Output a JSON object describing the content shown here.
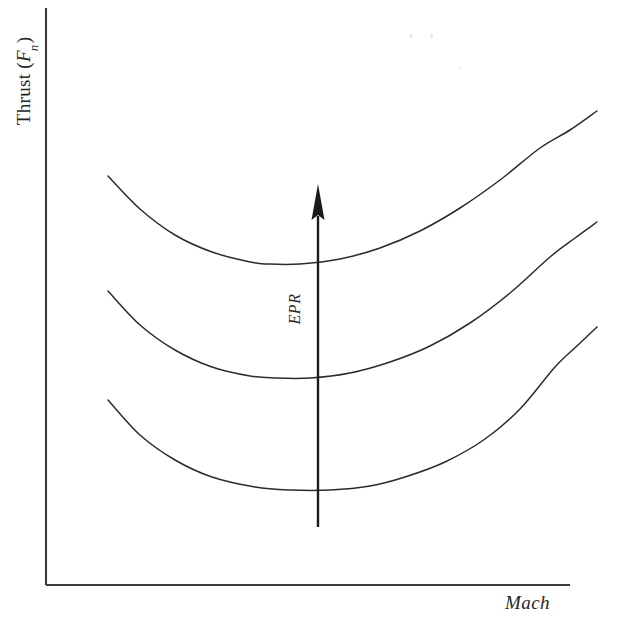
{
  "chart_data": {
    "type": "line",
    "title": "",
    "xlabel": "Mach",
    "ylabel": "Thrust (Fn)",
    "ylabel_main": "Thrust (",
    "ylabel_var": "F",
    "ylabel_sub": "n",
    "ylabel_close": ")",
    "grid": false,
    "legend": "none",
    "axis_ticks": "none",
    "xlim": [
      0,
      1
    ],
    "ylim": [
      0,
      1
    ],
    "annotations": [
      {
        "name": "epr-arrow",
        "text": "EPR",
        "direction": "up",
        "meaning": "Engine Pressure Ratio increasing",
        "x_px": 318,
        "y_start_px": 527,
        "y_end_px": 184
      }
    ],
    "series": [
      {
        "name": "High EPR",
        "order": 3,
        "points": [
          [
            108,
            176
          ],
          [
            140,
            209
          ],
          [
            175,
            235
          ],
          [
            212,
            252
          ],
          [
            250,
            262
          ],
          [
            268,
            264
          ],
          [
            300,
            264
          ],
          [
            340,
            259
          ],
          [
            380,
            248
          ],
          [
            420,
            231
          ],
          [
            460,
            208
          ],
          [
            500,
            180
          ],
          [
            540,
            148
          ],
          [
            570,
            130
          ],
          [
            597,
            111
          ]
        ]
      },
      {
        "name": "Mid EPR",
        "order": 2,
        "points": [
          [
            108,
            291
          ],
          [
            140,
            325
          ],
          [
            175,
            350
          ],
          [
            212,
            367
          ],
          [
            250,
            376
          ],
          [
            275,
            378
          ],
          [
            310,
            378
          ],
          [
            350,
            373
          ],
          [
            390,
            362
          ],
          [
            430,
            346
          ],
          [
            470,
            323
          ],
          [
            510,
            293
          ],
          [
            550,
            257
          ],
          [
            575,
            238
          ],
          [
            597,
            222
          ]
        ]
      },
      {
        "name": "Low EPR",
        "order": 1,
        "points": [
          [
            108,
            400
          ],
          [
            140,
            435
          ],
          [
            175,
            460
          ],
          [
            212,
            477
          ],
          [
            255,
            487
          ],
          [
            290,
            490
          ],
          [
            330,
            490
          ],
          [
            370,
            486
          ],
          [
            405,
            477
          ],
          [
            445,
            462
          ],
          [
            485,
            439
          ],
          [
            520,
            409
          ],
          [
            555,
            367
          ],
          [
            578,
            345
          ],
          [
            597,
            327
          ]
        ]
      }
    ],
    "axes": {
      "y_axis": {
        "x": 46,
        "y_top": 8,
        "y_bottom": 585
      },
      "x_axis": {
        "y": 585,
        "x_left": 46,
        "x_right": 570
      }
    }
  },
  "figure": {
    "stroke_color": "#2b2b2b",
    "axis_color": "#3a3a3a",
    "background": "#ffffff",
    "arrow_color": "#1a1a1a"
  }
}
